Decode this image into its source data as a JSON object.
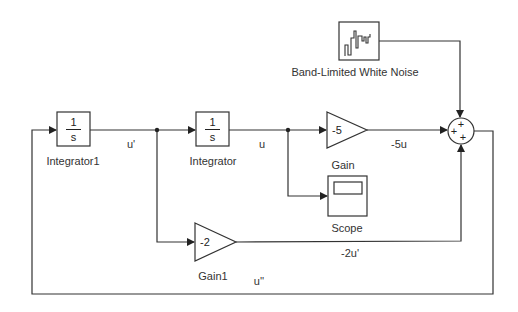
{
  "diagram": {
    "type": "simulink-block-diagram",
    "blocks": {
      "integrator1": {
        "name": "Integrator1",
        "numerator": "1",
        "denominator": "s"
      },
      "integrator": {
        "name": "Integrator",
        "numerator": "1",
        "denominator": "s"
      },
      "gain": {
        "name": "Gain",
        "value": "-5"
      },
      "gain1": {
        "name": "Gain1",
        "value": "-2"
      },
      "scope": {
        "name": "Scope"
      },
      "noise": {
        "name": "Band-Limited White Noise"
      },
      "sum": {
        "signs": [
          "+",
          "+",
          "+"
        ]
      }
    },
    "signals": {
      "u_prime": "u'",
      "u": "u",
      "minus_5u": "-5u",
      "minus_2u_prime": "-2u'",
      "u_double_prime": "u''"
    }
  }
}
